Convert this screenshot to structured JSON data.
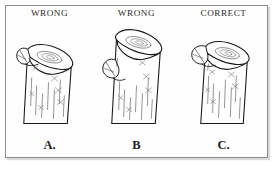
{
  "figure": {
    "border_color": "#8c8c8c",
    "background_color": "#ffffff",
    "ink_color": "#1a1a1a"
  },
  "panels": [
    {
      "verdict": "WRONG",
      "caption": "A.",
      "description": "Flush cut angled into the branch collar"
    },
    {
      "verdict": "WRONG",
      "caption": "B",
      "description": "Stub left too long above the branch collar"
    },
    {
      "verdict": "CORRECT",
      "caption": "C.",
      "description": "Cut made just outside the branch collar"
    }
  ]
}
